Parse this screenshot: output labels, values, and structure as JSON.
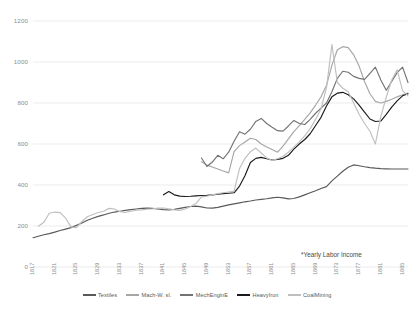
{
  "annotation": {
    "note": "*Yearly Labor Income"
  },
  "legend": {
    "position": "bottom",
    "items": [
      {
        "label": "Textiles",
        "color": "#595959"
      },
      {
        "label": "Mach-W. sl.",
        "color": "#a6a6a6"
      },
      {
        "label": "MechEnginE",
        "color": "#737373"
      },
      {
        "label": "HeavyIron",
        "color": "#1a1a1a"
      },
      {
        "label": "CoalMining",
        "color": "#bfbfbf"
      }
    ]
  },
  "axes": {
    "y_ticks": [
      "0",
      "200",
      "400",
      "600",
      "800",
      "1000",
      "1200"
    ],
    "x_ticks": [
      "1817",
      "1821",
      "1825",
      "1829",
      "1833",
      "1837",
      "1841",
      "1845",
      "1849",
      "1853",
      "1857",
      "1861",
      "1865",
      "1869",
      "1873",
      "1877",
      "1881",
      "1885"
    ]
  },
  "chart_data": {
    "type": "line",
    "title": "",
    "subtitle": "",
    "xlabel": "",
    "ylabel": "",
    "ylim": [
      0,
      1200
    ],
    "xlim": [
      1817,
      1886
    ],
    "grid": true,
    "legend_position": "bottom",
    "annotations": [
      "*Yearly Labor Income"
    ],
    "x": [
      1817,
      1818,
      1819,
      1820,
      1821,
      1822,
      1823,
      1824,
      1825,
      1826,
      1827,
      1828,
      1829,
      1830,
      1831,
      1832,
      1833,
      1834,
      1835,
      1836,
      1837,
      1838,
      1839,
      1840,
      1841,
      1842,
      1843,
      1844,
      1845,
      1846,
      1847,
      1848,
      1849,
      1850,
      1851,
      1852,
      1853,
      1854,
      1855,
      1856,
      1857,
      1858,
      1859,
      1860,
      1861,
      1862,
      1863,
      1864,
      1865,
      1866,
      1867,
      1868,
      1869,
      1870,
      1871,
      1872,
      1873,
      1874,
      1875,
      1876,
      1877,
      1878,
      1879,
      1880,
      1881,
      1882,
      1883,
      1884,
      1885,
      1886
    ],
    "series": [
      {
        "name": "Textiles",
        "color": "#595959",
        "values": [
          143,
          150,
          157,
          163,
          170,
          178,
          185,
          192,
          203,
          215,
          228,
          238,
          247,
          254,
          262,
          268,
          272,
          276,
          280,
          283,
          286,
          287,
          286,
          283,
          280,
          278,
          281,
          286,
          291,
          295,
          297,
          293,
          288,
          287,
          291,
          297,
          303,
          308,
          313,
          318,
          322,
          327,
          330,
          333,
          337,
          340,
          337,
          332,
          334,
          342,
          352,
          362,
          372,
          383,
          392,
          420,
          443,
          467,
          487,
          498,
          494,
          489,
          485,
          482,
          480,
          479,
          478,
          478,
          478,
          478
        ]
      },
      {
        "name": "Mach-W. sl.",
        "color": "#a6a6a6",
        "values": [
          null,
          null,
          null,
          null,
          null,
          null,
          null,
          null,
          null,
          null,
          null,
          null,
          null,
          null,
          null,
          null,
          null,
          null,
          null,
          null,
          null,
          null,
          null,
          null,
          null,
          null,
          null,
          null,
          null,
          null,
          null,
          513,
          497,
          488,
          478,
          468,
          459,
          563,
          592,
          610,
          628,
          622,
          600,
          585,
          573,
          560,
          590,
          625,
          660,
          690,
          720,
          752,
          790,
          830,
          885,
          985,
          1060,
          1075,
          1070,
          1035,
          980,
          905,
          845,
          808,
          800,
          808,
          818,
          830,
          840,
          848
        ]
      },
      {
        "name": "MechEnginE",
        "color": "#737373",
        "values": [
          null,
          null,
          null,
          null,
          null,
          null,
          null,
          null,
          null,
          null,
          null,
          null,
          null,
          null,
          null,
          null,
          null,
          null,
          null,
          null,
          null,
          null,
          null,
          null,
          null,
          null,
          null,
          null,
          null,
          null,
          null,
          532,
          490,
          512,
          545,
          528,
          560,
          613,
          660,
          648,
          672,
          710,
          725,
          700,
          682,
          665,
          663,
          688,
          715,
          700,
          695,
          720,
          750,
          775,
          800,
          855,
          920,
          955,
          950,
          930,
          920,
          915,
          945,
          975,
          912,
          862,
          905,
          948,
          975,
          900
        ]
      },
      {
        "name": "HeavyIron",
        "color": "#1a1a1a",
        "values": [
          null,
          null,
          null,
          null,
          null,
          null,
          null,
          null,
          null,
          null,
          null,
          null,
          null,
          null,
          null,
          null,
          null,
          null,
          null,
          null,
          null,
          null,
          null,
          null,
          352,
          368,
          352,
          346,
          344,
          345,
          347,
          349,
          350,
          352,
          355,
          358,
          360,
          362,
          395,
          445,
          510,
          530,
          535,
          528,
          522,
          525,
          530,
          545,
          575,
          600,
          622,
          650,
          690,
          730,
          785,
          830,
          848,
          852,
          840,
          820,
          790,
          755,
          722,
          710,
          712,
          745,
          780,
          810,
          835,
          845
        ]
      },
      {
        "name": "CoalMining",
        "color": "#bfbfbf",
        "values": [
          null,
          199,
          218,
          262,
          268,
          265,
          238,
          196,
          192,
          222,
          245,
          256,
          266,
          272,
          286,
          283,
          270,
          266,
          272,
          277,
          279,
          282,
          284,
          287,
          288,
          284,
          279,
          276,
          283,
          295,
          310,
          342,
          345,
          352,
          358,
          362,
          366,
          370,
          480,
          530,
          562,
          580,
          556,
          532,
          520,
          528,
          540,
          560,
          585,
          610,
          640,
          675,
          720,
          772,
          875,
          1085,
          900,
          872,
          855,
          800,
          745,
          700,
          662,
          600,
          735,
          828,
          912,
          962,
          860,
          835
        ]
      }
    ]
  }
}
